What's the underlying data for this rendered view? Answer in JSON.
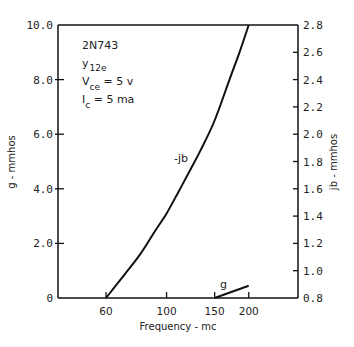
{
  "chart_data": {
    "type": "line",
    "title": "",
    "annotations": {
      "device": "2N743",
      "param_main": "y",
      "param_sub": "12e",
      "vce_main": "V",
      "vce_sub": "ce",
      "vce_value": " = 5 v",
      "ic_main": "I",
      "ic_sub": "c",
      "ic_value": " = 5 ma"
    },
    "xlabel": "Frequency - mc",
    "ylabel_left": "g - mmhos",
    "ylabel_right": "jb - mmhos",
    "xscale": "log",
    "xlim": [
      40,
      280
    ],
    "ylim_left": [
      0,
      10.0
    ],
    "ylim_right": [
      0.8,
      2.8
    ],
    "x_ticks": [
      60,
      100,
      150,
      200
    ],
    "x_tick_labels": [
      "60",
      "100",
      "150",
      "200"
    ],
    "y_left_ticks": [
      0,
      2.0,
      4.0,
      6.0,
      8.0,
      10.0
    ],
    "y_left_tick_labels": [
      "0",
      "2.0",
      "4.0",
      "6.0",
      "8.0",
      "10.0"
    ],
    "y_right_ticks": [
      0.8,
      1.0,
      1.2,
      1.4,
      1.6,
      1.8,
      2.0,
      2.2,
      2.4,
      2.6,
      2.8
    ],
    "y_right_tick_labels": [
      "0.8",
      "1.0",
      "1.2",
      "1.4",
      "1.6",
      "1.8",
      "2.0",
      "2.2",
      "2.4",
      "2.6",
      "2.8"
    ],
    "grid": false,
    "series": [
      {
        "name": "-jb",
        "label": "-jb",
        "axis": "right",
        "x": [
          60,
          70,
          80,
          90,
          100,
          110,
          120,
          133,
          150,
          170,
          185,
          200
        ],
        "y": [
          0.8,
          0.97,
          1.12,
          1.28,
          1.42,
          1.57,
          1.71,
          1.88,
          2.1,
          2.4,
          2.6,
          2.8
        ]
      },
      {
        "name": "g",
        "label": "g",
        "axis": "left",
        "x": [
          150,
          200
        ],
        "y": [
          0,
          0.45
        ]
      }
    ]
  }
}
